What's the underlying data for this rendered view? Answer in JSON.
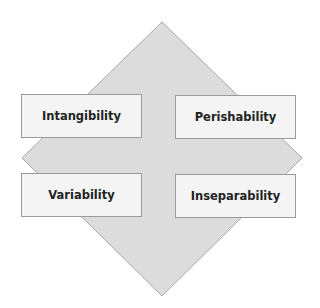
{
  "diagram": {
    "shape": "diamond",
    "colors": {
      "diamond_fill": "#dcdcdc",
      "diamond_stroke": "#a8a8a8",
      "box_fill": "#f4f4f4",
      "box_stroke": "#9a9a9a"
    },
    "boxes": [
      {
        "position": "top-left",
        "label": "Intangibility"
      },
      {
        "position": "top-right",
        "label": "Perishability"
      },
      {
        "position": "bottom-left",
        "label": "Variability"
      },
      {
        "position": "bottom-right",
        "label": "Inseparability"
      }
    ]
  }
}
